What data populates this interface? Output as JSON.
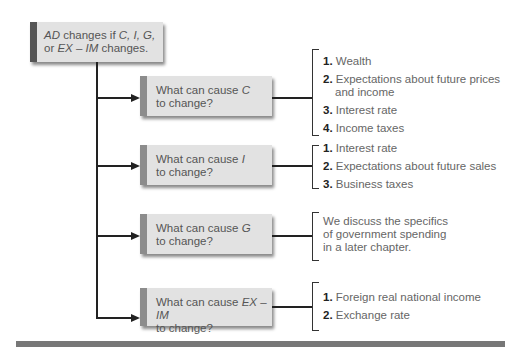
{
  "root": {
    "line1_prefix": "AD",
    "line1_rest": " changes if ",
    "line1_vars": "C, I, G,",
    "line2_prefix": "or ",
    "line2_vars": "EX – IM",
    "line2_rest": " changes."
  },
  "branches": [
    {
      "q_prefix": "What can cause ",
      "q_var": "C",
      "q_line2": "to change?",
      "items": [
        {
          "num": "1.",
          "text": "Wealth"
        },
        {
          "num": "2.",
          "text": "Expectations about future prices and income"
        },
        {
          "num": "3.",
          "text": "Interest rate"
        },
        {
          "num": "4.",
          "text": "Income taxes"
        }
      ]
    },
    {
      "q_prefix": "What can cause ",
      "q_var": "I",
      "q_line2": "to change?",
      "items": [
        {
          "num": "1.",
          "text": "Interest rate"
        },
        {
          "num": "2.",
          "text": "Expectations about future sales"
        },
        {
          "num": "3.",
          "text": "Business taxes"
        }
      ]
    },
    {
      "q_prefix": "What can cause ",
      "q_var": "G",
      "q_line2": "to change?",
      "note": "We discuss the specifics of government spending in a later chapter."
    },
    {
      "q_prefix": "What can cause ",
      "q_var": "EX – IM",
      "q_line2": "to change?",
      "items": [
        {
          "num": "1.",
          "text": "Foreign real national income"
        },
        {
          "num": "2.",
          "text": "Exchange rate"
        }
      ]
    }
  ]
}
